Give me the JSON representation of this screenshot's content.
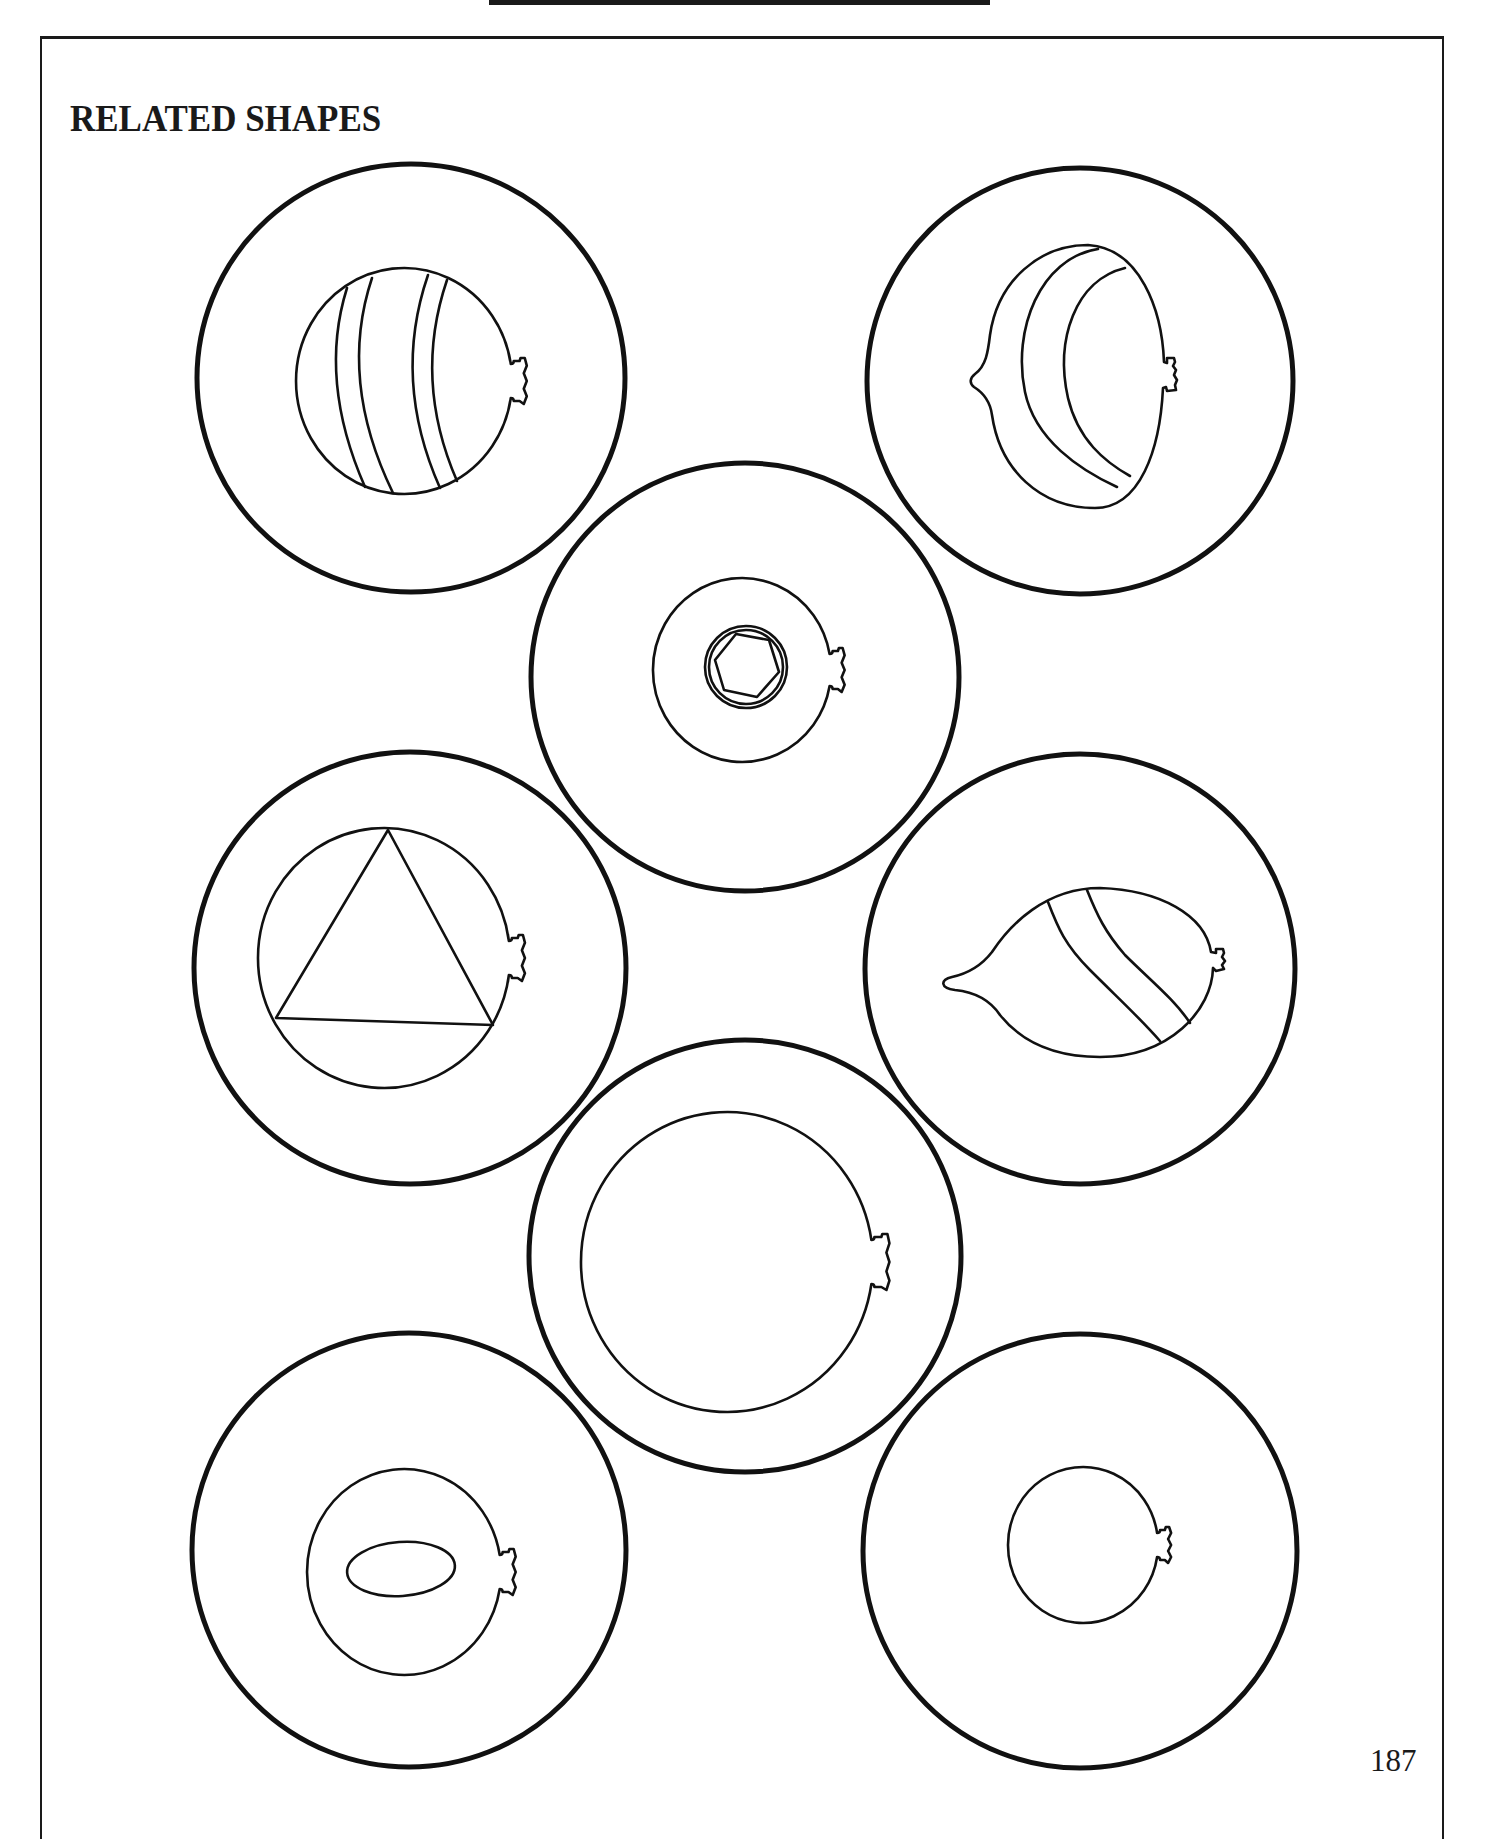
{
  "page": {
    "title": "RELATED SHAPES",
    "page_number": "187",
    "ink_color": "#111111",
    "paper_color": "#ffffff"
  },
  "circles": [
    {
      "id": "top-left-striped-balloon",
      "outer": {
        "cx": 411,
        "cy": 378,
        "r": 214
      },
      "balloon": {
        "cx": 404,
        "cy": 381,
        "rx": 108,
        "ry": 113,
        "knot_h": 17,
        "knot_w": 16
      },
      "stripes": [
        "M347,288 Q318,380 365,487",
        "M372,278 Q338,380 393,493",
        "M428,275 Q392,380 440,488",
        "M447,280 Q413,380 457,481"
      ]
    },
    {
      "id": "top-right-crescent-striped-balloon",
      "outer": {
        "cx": 1080,
        "cy": 381,
        "r": 213
      },
      "custom_path": "M1088,245 C1140,248 1162,310 1164,362 L1167,363 L1167,358 L1174,358 L1175,362 L1173,366 L1176,370 L1174,375 L1177,380 L1175,385 L1176,390 L1167,391 L1166,387 L1163,388 C1160,450 1140,508 1095,508 C1040,508 1000,470 992,415 C990,400 982,392 974,387 C969,383 970,378 975,374 C986,366 988,352 990,335 C998,280 1040,245 1088,245 Z",
      "stripes": [
        "M1098,249 C1040,258 1012,330 1025,392 C1035,440 1080,470 1117,487",
        "M1125,268 C1075,280 1055,340 1068,398 C1078,440 1105,462 1130,476"
      ]
    },
    {
      "id": "center-hexagon-balloon",
      "outer": {
        "cx": 745,
        "cy": 677,
        "r": 214
      },
      "balloon": {
        "cx": 742,
        "cy": 670,
        "rx": 89,
        "ry": 92,
        "knot_h": 16,
        "knot_w": 15
      },
      "inner_circle": {
        "cx": 746,
        "cy": 667,
        "r": 41,
        "inner_r": 37
      },
      "hexagon": "715,660 736,634 769,640 779,672 757,697 724,690"
    },
    {
      "id": "left-triangle-balloon",
      "outer": {
        "cx": 410,
        "cy": 968,
        "r": 216
      },
      "balloon": {
        "cx": 384,
        "cy": 958,
        "rx": 126,
        "ry": 130,
        "knot_h": 17,
        "knot_w": 16
      },
      "triangle": "388,830 276,1018 493,1025"
    },
    {
      "id": "right-lemon-striped-balloon",
      "outer": {
        "cx": 1080,
        "cy": 969,
        "r": 215
      },
      "custom_path": "M1100,888 C1160,890 1205,915 1211,952 L1216,953 L1216,949 L1223,949 L1224,953 L1222,957 L1225,961 L1222,965 L1224,969 L1216,971 L1213,968 C1212,1010 1170,1057 1100,1057 C1050,1057 1020,1040 1000,1015 C990,1000 975,992 955,990 C940,988 940,980 952,977 C970,973 982,965 992,952 C1010,925 1045,888 1100,888 Z",
      "stripes": [
        "M1048,902 C1058,928 1065,945 1090,970 C1120,1000 1140,1018 1160,1041",
        "M1087,890 C1097,915 1105,932 1125,955 C1150,980 1175,1000 1190,1023"
      ]
    },
    {
      "id": "center-large-plain-balloon",
      "outer": {
        "cx": 745,
        "cy": 1256,
        "r": 216
      },
      "balloon": {
        "cx": 727,
        "cy": 1262,
        "rx": 146,
        "ry": 150,
        "knot_h": 22,
        "knot_w": 18
      }
    },
    {
      "id": "bottom-left-oval-balloon",
      "outer": {
        "cx": 409,
        "cy": 1550,
        "r": 217
      },
      "balloon": {
        "cx": 404,
        "cy": 1572,
        "rx": 97,
        "ry": 103,
        "knot_h": 17,
        "knot_w": 16
      },
      "oval": {
        "cx": 401,
        "cy": 1569,
        "rx": 54,
        "ry": 27,
        "rotate": -4
      }
    },
    {
      "id": "bottom-right-small-plain-balloon",
      "outer": {
        "cx": 1080,
        "cy": 1551,
        "r": 217
      },
      "balloon": {
        "cx": 1083,
        "cy": 1545,
        "rx": 75,
        "ry": 78,
        "knot_h": 12,
        "knot_w": 14
      }
    }
  ]
}
